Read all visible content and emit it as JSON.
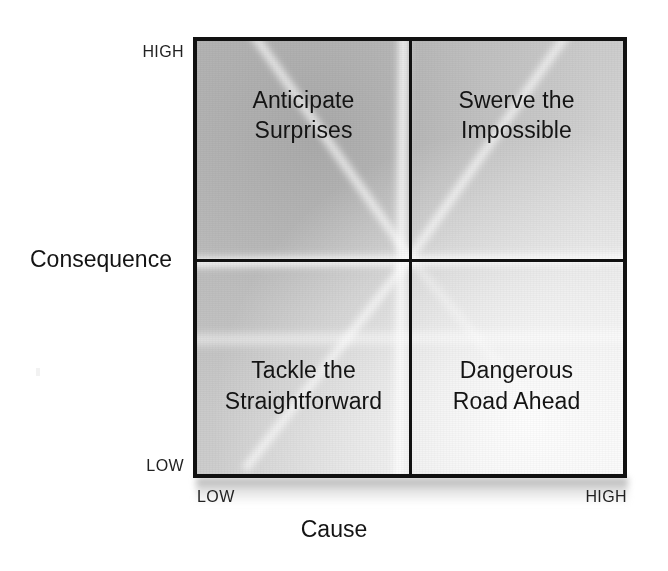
{
  "chart_data": {
    "type": "table",
    "title": "",
    "xlabel": "Cause",
    "ylabel": "Consequence",
    "x_ticks": [
      "LOW",
      "HIGH"
    ],
    "y_ticks": [
      "LOW",
      "HIGH"
    ],
    "grid": true,
    "legend": "none",
    "categories": [
      "Low Cause",
      "High Cause"
    ],
    "rows": [
      "High Consequence",
      "Low Consequence"
    ],
    "cells": [
      {
        "x": "LOW",
        "y": "HIGH",
        "label": "Anticipate Surprises"
      },
      {
        "x": "HIGH",
        "y": "HIGH",
        "label": "Swerve the Impossible"
      },
      {
        "x": "LOW",
        "y": "LOW",
        "label": "Tackle the Straightforward"
      },
      {
        "x": "HIGH",
        "y": "LOW",
        "label": "Dangerous Road Ahead"
      }
    ]
  },
  "axes": {
    "x_title": "Cause",
    "y_title": "Consequence",
    "x_low": "LOW",
    "x_high": "HIGH",
    "y_low": "LOW",
    "y_high": "HIGH"
  },
  "quadrants": {
    "top_left": {
      "line1": "Anticipate",
      "line2": "Surprises"
    },
    "top_right": {
      "line1": "Swerve the",
      "line2": "Impossible"
    },
    "bottom_left": {
      "line1": "Tackle the",
      "line2": "Straightforward"
    },
    "bottom_right": {
      "line1": "Dangerous",
      "line2": "Road Ahead"
    }
  },
  "colors": {
    "line": "#111111",
    "text": "#141414",
    "background": "#ffffff",
    "fill_light": "#f2f2f2",
    "fill_dark": "#b9b9b9"
  }
}
